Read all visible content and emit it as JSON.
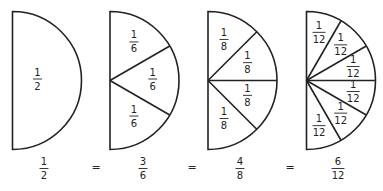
{
  "diagram": {
    "semicircles": [
      {
        "label": {
          "num": "1",
          "den": "2"
        },
        "pieces": 1,
        "piece_labels": [
          {
            "num": "1",
            "den": "2"
          }
        ]
      },
      {
        "label": {
          "num": "3",
          "den": "6"
        },
        "pieces": 3,
        "piece_labels": [
          {
            "num": "1",
            "den": "6"
          },
          {
            "num": "1",
            "den": "6"
          },
          {
            "num": "1",
            "den": "6"
          }
        ]
      },
      {
        "label": {
          "num": "4",
          "den": "8"
        },
        "pieces": 4,
        "piece_labels": [
          {
            "num": "1",
            "den": "8"
          },
          {
            "num": "1",
            "den": "8"
          },
          {
            "num": "1",
            "den": "8"
          },
          {
            "num": "1",
            "den": "8"
          }
        ]
      },
      {
        "label": {
          "num": "6",
          "den": "12"
        },
        "pieces": 6,
        "piece_labels": [
          {
            "num": "1",
            "den": "12"
          },
          {
            "num": "1",
            "den": "12"
          },
          {
            "num": "1",
            "den": "12"
          },
          {
            "num": "1",
            "den": "12"
          },
          {
            "num": "1",
            "den": "12"
          },
          {
            "num": "1",
            "den": "12"
          }
        ]
      }
    ],
    "equals_sign": "=",
    "colors": {
      "stroke": "#222222",
      "fill": "#ffffff"
    }
  }
}
